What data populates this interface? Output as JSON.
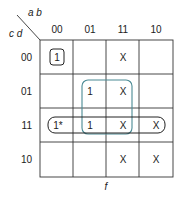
{
  "kmap": {
    "row_var_label": "c d",
    "col_var_label": "a b",
    "columns": [
      "00",
      "01",
      "11",
      "10"
    ],
    "rows": [
      "00",
      "01",
      "11",
      "10"
    ],
    "cells": [
      [
        "1",
        "",
        "X",
        ""
      ],
      [
        "",
        "1",
        "X",
        ""
      ],
      [
        "1*",
        "1",
        "X",
        "X"
      ],
      [
        "",
        "",
        "X",
        "X"
      ]
    ],
    "function_label": "f",
    "colors": {
      "grid": "#333333",
      "group_black": "#222222",
      "group_teal": "#4a8a94"
    },
    "groups": [
      {
        "name": "single-minterm-group",
        "cells": [
          [
            0,
            0
          ]
        ],
        "color": "#222222"
      },
      {
        "name": "quad-group",
        "cells": [
          [
            1,
            1
          ],
          [
            1,
            2
          ],
          [
            2,
            1
          ],
          [
            2,
            2
          ]
        ],
        "color": "#4a8a94"
      },
      {
        "name": "row-group",
        "cells": [
          [
            2,
            0
          ],
          [
            2,
            1
          ],
          [
            2,
            2
          ],
          [
            2,
            3
          ]
        ],
        "color": "#222222"
      }
    ]
  }
}
